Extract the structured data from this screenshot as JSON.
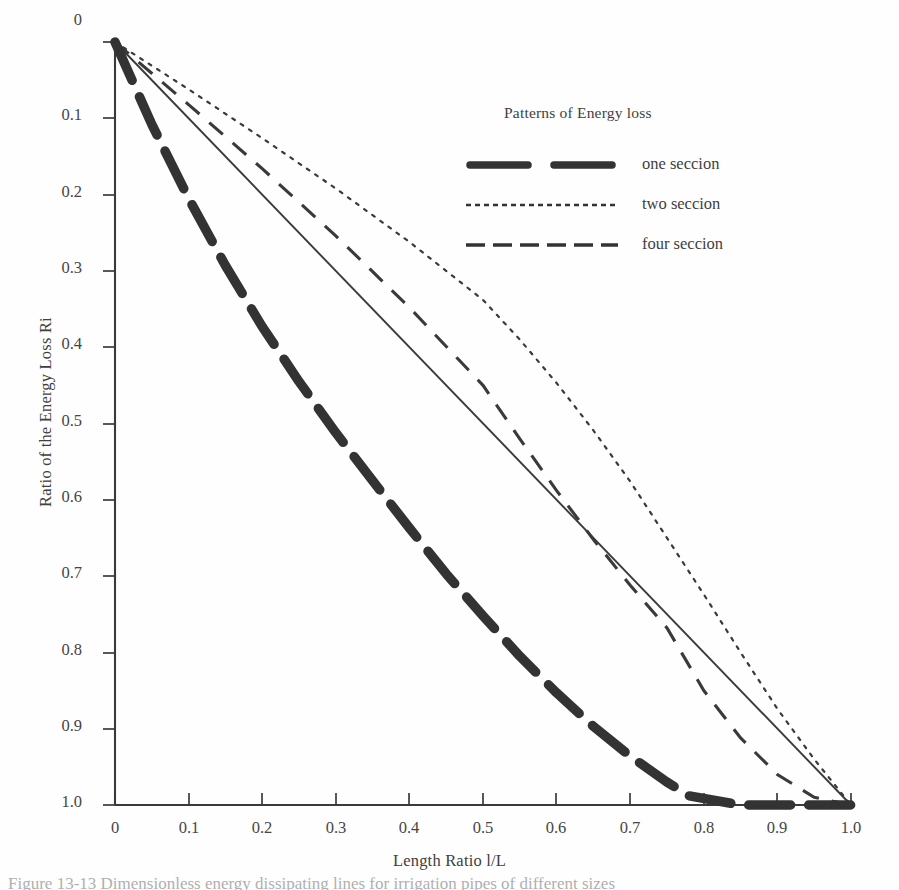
{
  "figure": {
    "background_color": "#fefefe",
    "ink_color": "#353535",
    "caption_text": "Figure 13-13  Dimensionless energy dissipating lines for irrigation pipes of different sizes"
  },
  "axes": {
    "x_title": "Length Ratio l/L",
    "y_title": "Ratio of the Energy Loss Ri",
    "x_ticks": [
      "0",
      "0.1",
      "0.2",
      "0.3",
      "0.4",
      "0.5",
      "0.6",
      "0.7",
      "0.8",
      "0.9",
      "1.0"
    ],
    "y_ticks": [
      "0",
      "0.1",
      "0.2",
      "0.3",
      "0.4",
      "0.5",
      "0.6",
      "0.7",
      "0.8",
      "0.9",
      "1.0"
    ]
  },
  "legend": {
    "title": "Patterns of Energy loss",
    "entries": [
      {
        "label": "one seccion",
        "style": "thick-long-dash"
      },
      {
        "label": "two seccion",
        "style": "fine-dotted"
      },
      {
        "label": "four seccion",
        "style": "medium-dash"
      }
    ]
  },
  "chart_data": {
    "type": "line",
    "title": "",
    "xlabel": "Length Ratio l/L",
    "ylabel": "Ratio of the Energy Loss Ri",
    "xlim": [
      0,
      1
    ],
    "ylim": [
      0,
      1
    ],
    "y_axis_inverted": true,
    "grid": false,
    "legend_position": "upper-right-inside",
    "series": [
      {
        "name": "reference",
        "style": "solid-thin",
        "in_legend": false,
        "x": [
          0,
          1
        ],
        "y": [
          0,
          1
        ]
      },
      {
        "name": "one seccion",
        "style": "thick-long-dash",
        "in_legend": true,
        "x": [
          0,
          0.05,
          0.1,
          0.15,
          0.2,
          0.25,
          0.3,
          0.35,
          0.4,
          0.45,
          0.5,
          0.55,
          0.6,
          0.65,
          0.7,
          0.75,
          0.78,
          0.85,
          0.9,
          1.0
        ],
        "y": [
          0,
          0.108,
          0.205,
          0.293,
          0.373,
          0.445,
          0.512,
          0.575,
          0.637,
          0.697,
          0.752,
          0.805,
          0.853,
          0.897,
          0.936,
          0.97,
          0.988,
          1.0,
          1.0,
          1.0
        ]
      },
      {
        "name": "two seccion",
        "style": "fine-dotted",
        "in_legend": true,
        "x": [
          0,
          0.1,
          0.2,
          0.3,
          0.4,
          0.5,
          0.55,
          0.6,
          0.65,
          0.7,
          0.75,
          0.8,
          0.85,
          0.9,
          0.95,
          1.0
        ],
        "y": [
          0,
          0.062,
          0.126,
          0.192,
          0.262,
          0.338,
          0.39,
          0.447,
          0.509,
          0.576,
          0.65,
          0.724,
          0.8,
          0.874,
          0.94,
          1.0
        ]
      },
      {
        "name": "four seccion",
        "style": "medium-dash",
        "in_legend": true,
        "x": [
          0,
          0.1,
          0.2,
          0.3,
          0.4,
          0.5,
          0.55,
          0.6,
          0.65,
          0.7,
          0.75,
          0.8,
          0.85,
          0.9,
          0.95,
          1.0
        ],
        "y": [
          0,
          0.082,
          0.166,
          0.254,
          0.348,
          0.45,
          0.52,
          0.588,
          0.652,
          0.712,
          0.768,
          0.85,
          0.912,
          0.96,
          0.99,
          1.0
        ]
      }
    ]
  }
}
